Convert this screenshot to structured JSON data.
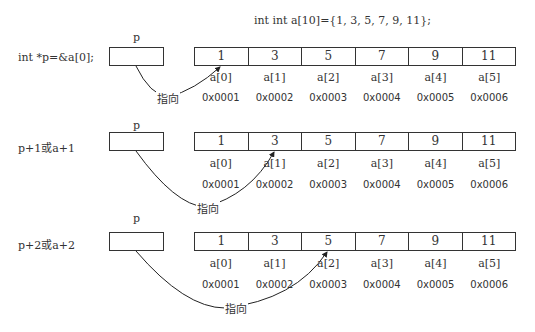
{
  "title": "int int a[10]={1, 3, 5, 7, 9, 11};",
  "pointer_label": "p",
  "points_to_label": "指向",
  "array": {
    "values": [
      "1",
      "3",
      "5",
      "7",
      "9",
      "11"
    ],
    "indices": [
      "a[0]",
      "a[1]",
      "a[2]",
      "a[3]",
      "a[4]",
      "a[5]"
    ],
    "addresses": [
      "0x0001",
      "0x0002",
      "0x0003",
      "0x0004",
      "0x0005",
      "0x0006"
    ]
  },
  "rows": [
    {
      "label": "int *p=&a[0];",
      "target_index": 0
    },
    {
      "label": "p+1或a+1",
      "target_index": 1
    },
    {
      "label": "p+2或a+2",
      "target_index": 2
    }
  ]
}
